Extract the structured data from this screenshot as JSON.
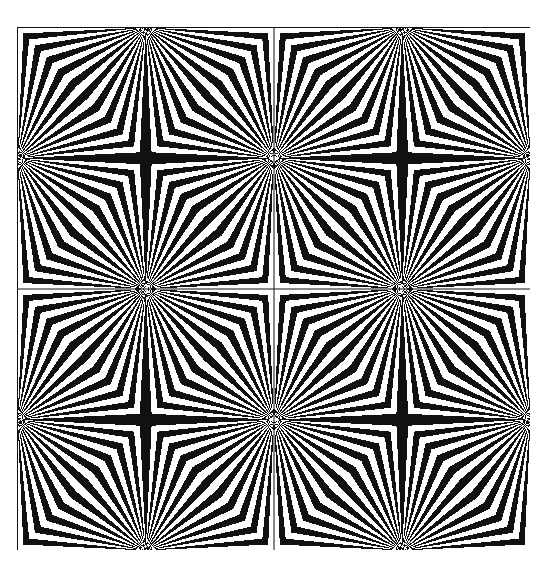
{
  "artwork": {
    "description": "Op-art pattern of 2x2 tiles with radiating black and white rays converging at tile edge midpoints, forming chevron bands",
    "grid": {
      "rows": 2,
      "cols": 2
    },
    "stripes_per_quadrant": 11,
    "colors": {
      "ink": "#111111",
      "paper": "#ffffff"
    }
  }
}
